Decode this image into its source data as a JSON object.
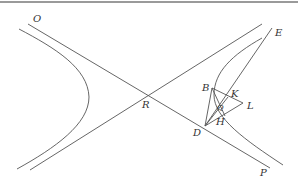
{
  "diagram": {
    "type": "hyperbola-construction",
    "points": {
      "O": {
        "label": "O",
        "x": 28,
        "y": 24,
        "label_x": 33,
        "label_y": 22
      },
      "R": {
        "label": "R",
        "x": 147,
        "y": 95,
        "label_x": 142,
        "label_y": 108
      },
      "E": {
        "label": "E",
        "x": 272,
        "y": 28,
        "label_x": 275,
        "label_y": 36
      },
      "B": {
        "label": "B",
        "x": 212,
        "y": 88,
        "label_x": 202,
        "label_y": 91
      },
      "K": {
        "label": "K",
        "x": 228,
        "y": 97,
        "label_x": 231,
        "label_y": 97
      },
      "L": {
        "label": "L",
        "x": 243,
        "y": 103,
        "label_x": 247,
        "label_y": 109
      },
      "Q": {
        "label": "Q",
        "x": 220,
        "y": 106,
        "label_x": 218,
        "label_y": 110
      },
      "H": {
        "label": "H",
        "x": 223,
        "y": 113,
        "label_x": 216,
        "label_y": 125
      },
      "D": {
        "label": "D",
        "x": 205,
        "y": 126,
        "label_x": 193,
        "label_y": 136
      },
      "P": {
        "label": "P",
        "x": 270,
        "y": 168,
        "label_x": 260,
        "label_y": 176
      }
    },
    "asymptotes": [
      {
        "name": "asymptote-OP",
        "from": "O",
        "to": "P"
      },
      {
        "name": "asymptote-second",
        "x1": 30,
        "y1": 170,
        "x2": 262,
        "y2": 24
      }
    ],
    "segments": [
      {
        "name": "segment-ED",
        "from": "E",
        "to": "D"
      },
      {
        "name": "segment-EH",
        "from": "E",
        "to": "H"
      },
      {
        "name": "segment-BD",
        "from": "B",
        "to": "D"
      },
      {
        "name": "segment-BL",
        "from": "B",
        "to": "L"
      },
      {
        "name": "segment-LD",
        "from": "L",
        "to": "D"
      },
      {
        "name": "segment-BH",
        "from": "B",
        "to": "H"
      }
    ],
    "branches": [
      {
        "name": "left-branch"
      },
      {
        "name": "right-branch"
      }
    ],
    "colors": {
      "stroke": "#555555",
      "label": "#333333",
      "border": "#9a9a9a",
      "background": "#ffffff"
    }
  }
}
